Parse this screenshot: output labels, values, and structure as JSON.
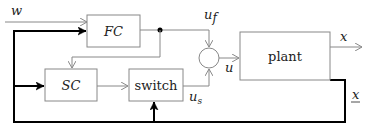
{
  "diagram": {
    "type": "block-diagram",
    "blocks": [
      {
        "id": "fc",
        "label": "FC"
      },
      {
        "id": "sc",
        "label": "SC"
      },
      {
        "id": "switch",
        "label": "switch"
      },
      {
        "id": "plant",
        "label": "plant"
      },
      {
        "id": "sum",
        "label": ""
      }
    ],
    "signals": {
      "w": "w",
      "u_f": "u",
      "u_f_sub": "f",
      "u_s": "u",
      "u_s_sub": "s",
      "u": "u",
      "x_out": "x",
      "x_state": "x"
    },
    "edges": [
      {
        "from": "w",
        "to": "fc"
      },
      {
        "from": "x_state",
        "to": "fc",
        "style": "thick"
      },
      {
        "from": "x_state",
        "to": "sc",
        "style": "thick"
      },
      {
        "from": "x_state",
        "to": "switch",
        "style": "thick"
      },
      {
        "from": "fc",
        "to": "sum",
        "label": "u_f"
      },
      {
        "from": "fc",
        "to": "sc"
      },
      {
        "from": "sc",
        "to": "switch"
      },
      {
        "from": "switch",
        "to": "sum",
        "label": "u_s"
      },
      {
        "from": "sum",
        "to": "plant",
        "label": "u"
      },
      {
        "from": "plant",
        "to": "output",
        "label": "x"
      },
      {
        "from": "plant",
        "to": "x_state",
        "style": "thick"
      }
    ]
  }
}
